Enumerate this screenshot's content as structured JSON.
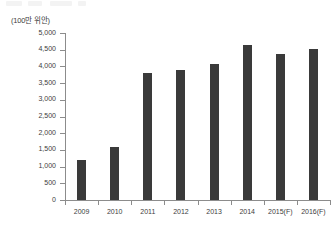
{
  "chart_data": {
    "type": "bar",
    "title": "",
    "subtitle": "",
    "unit_label": "(100만 위안)",
    "xlabel": "",
    "ylabel": "",
    "categories": [
      "2009",
      "2010",
      "2011",
      "2012",
      "2013",
      "2014",
      "2015(F)",
      "2016(F)"
    ],
    "values": [
      1200,
      1580,
      3800,
      3880,
      4080,
      4650,
      4380,
      4530
    ],
    "series": [
      {
        "name": "",
        "values": [
          1200,
          1580,
          3800,
          3880,
          4080,
          4650,
          4380,
          4530
        ]
      }
    ],
    "ylim": [
      0,
      5000
    ],
    "ytick_values": [
      0,
      500,
      1000,
      1500,
      2000,
      2500,
      3000,
      3500,
      4000,
      4500,
      5000
    ],
    "ytick_labels": [
      "0",
      "500",
      "1,000",
      "1,500",
      "2,000",
      "2,500",
      "3,000",
      "3,500",
      "4,000",
      "4,500",
      "5,000"
    ],
    "grid": false,
    "legend": null,
    "legend_position": "none",
    "bar_color": "#3a3a3a",
    "axis_color": "#8c8c8c",
    "text_color": "#3d3d3d",
    "background": "#ffffff",
    "annotations": []
  }
}
